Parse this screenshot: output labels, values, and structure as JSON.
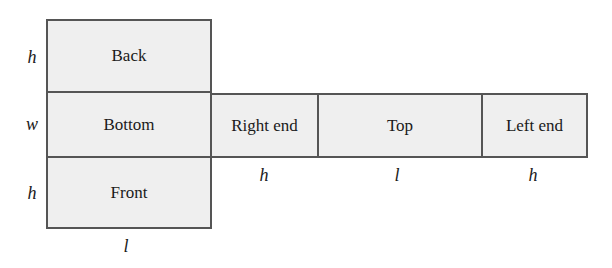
{
  "diagram": {
    "colors": {
      "fill": "#efefef",
      "border": "#555555",
      "text": "#1a1a1a"
    },
    "faces": [
      {
        "id": "back",
        "label": "Back"
      },
      {
        "id": "bottom",
        "label": "Bottom"
      },
      {
        "id": "front",
        "label": "Front"
      },
      {
        "id": "right-end",
        "label": "Right end"
      },
      {
        "id": "top",
        "label": "Top"
      },
      {
        "id": "left-end",
        "label": "Left end"
      }
    ],
    "dimensions": {
      "left_side": [
        "h",
        "w",
        "h"
      ],
      "below_column": "l",
      "below_row": [
        "h",
        "l",
        "h"
      ]
    }
  }
}
